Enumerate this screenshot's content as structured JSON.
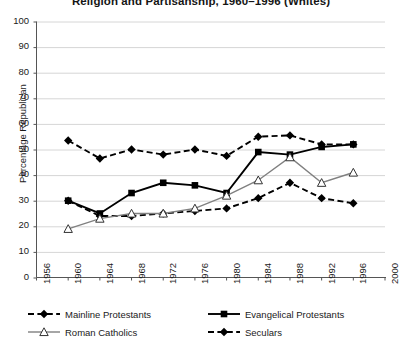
{
  "chart_data": {
    "type": "line",
    "title": "Religion and Partisanship, 1960–1996 (Whites)",
    "xlabel": "",
    "ylabel": "Percentage Republican",
    "x": [
      1960,
      1964,
      1968,
      1972,
      1976,
      1980,
      1984,
      1988,
      1992,
      1996
    ],
    "xlim": [
      1956,
      2000
    ],
    "ylim": [
      0,
      100
    ],
    "xticks": [
      "1956",
      "1960",
      "1964",
      "1968",
      "1972",
      "1976",
      "1980",
      "1984",
      "1988",
      "1992",
      "1996",
      "2000"
    ],
    "yticks": [
      "0",
      "10",
      "20",
      "30",
      "40",
      "50",
      "60",
      "70",
      "80",
      "90",
      "100"
    ],
    "grid": "horizontal",
    "legend_position": "bottom-left",
    "series": [
      {
        "name": "Mainline Protestants",
        "marker": "diamond-filled",
        "line": "dashed",
        "color": "#000000",
        "values": [
          30,
          24,
          24,
          25,
          26,
          27,
          31,
          37,
          31,
          29
        ]
      },
      {
        "name": "Evangelical Protestants",
        "marker": "square-filled",
        "line": "solid",
        "color": "#000000",
        "values": [
          30,
          25,
          33,
          37,
          36,
          33,
          49,
          48,
          51,
          52
        ]
      },
      {
        "name": "Roman Catholics",
        "marker": "triangle-open",
        "line": "solid",
        "color": "#808080",
        "values": [
          19,
          23,
          25,
          25,
          27,
          32,
          38,
          47,
          37,
          41
        ]
      },
      {
        "name": "Seculars",
        "marker": "diamond-filled",
        "line": "dashed",
        "color": "#000000",
        "values": [
          53.5,
          46.5,
          50,
          48,
          50,
          47.5,
          55,
          55.5,
          52,
          52
        ]
      }
    ]
  },
  "legend": {
    "items": [
      {
        "label": "Mainline Protestants"
      },
      {
        "label": "Evangelical Protestants"
      },
      {
        "label": "Roman Catholics"
      },
      {
        "label": "Seculars"
      }
    ]
  }
}
